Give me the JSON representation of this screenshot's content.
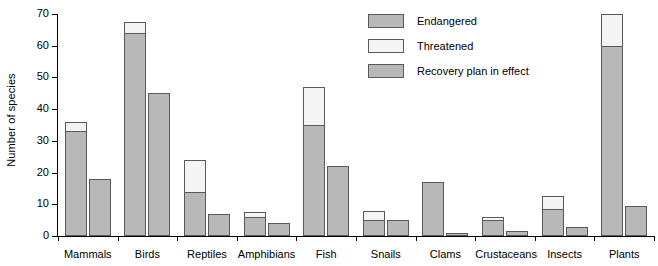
{
  "chart_data": {
    "type": "bar",
    "title": "",
    "xlabel": "",
    "ylabel": "Number of species",
    "ylim": [
      0,
      70
    ],
    "yticks": [
      0,
      10,
      20,
      30,
      40,
      50,
      60,
      70
    ],
    "grid": false,
    "legend_position": "top-right",
    "categories": [
      "Mammals",
      "Birds",
      "Reptiles",
      "Amphibians",
      "Fish",
      "Snails",
      "Clams",
      "Crustaceans",
      "Insects",
      "Plants"
    ],
    "series": [
      {
        "name": "Endangered",
        "color": "#b8b8b8",
        "values": [
          33,
          64,
          14,
          6,
          35,
          5,
          17,
          5,
          8.5,
          60
        ]
      },
      {
        "name": "Threatened",
        "color": "#f4f4f4",
        "values": [
          3,
          3.5,
          10,
          1.5,
          12,
          3,
          0,
          1,
          4,
          10
        ]
      },
      {
        "name": "Recovery plan in effect",
        "color": "#b8b8b8",
        "values": [
          18,
          45,
          7,
          4,
          22,
          5,
          1,
          1.5,
          3,
          9.5
        ]
      }
    ],
    "totals_endangered_threatened": [
      36,
      67.5,
      24,
      7.5,
      47,
      8,
      17,
      6,
      12.5,
      70
    ],
    "legend": [
      {
        "label": "Endangered",
        "swatch": "#b8b8b8"
      },
      {
        "label": "Threatened",
        "swatch": "#f4f4f4"
      },
      {
        "label": "Recovery plan in effect",
        "swatch": "#b8b8b8"
      }
    ]
  }
}
